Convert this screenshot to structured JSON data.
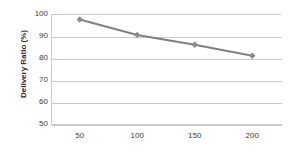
{
  "chart_data": {
    "type": "line",
    "title": "",
    "xlabel": "",
    "ylabel": "Delivery Ratio (%)",
    "x": [
      50,
      100,
      150,
      200
    ],
    "xtick_labels": [
      "50",
      "100",
      "150",
      "200"
    ],
    "ytick_labels": [
      "100",
      "90",
      "80",
      "70",
      "60",
      "50"
    ],
    "yticks": [
      100,
      90,
      80,
      70,
      60,
      50
    ],
    "xlim": [
      25,
      225
    ],
    "ylim": [
      50,
      100
    ],
    "grid": "horizontal",
    "legend": "none",
    "series": [
      {
        "name": "Delivery Ratio",
        "values": [
          97.5,
          90.5,
          86.0,
          81.0
        ],
        "color": "#808080",
        "marker": "diamond",
        "marker_color": "#8a8a8a"
      }
    ]
  },
  "style": {
    "grid_color": "#c9c9c9",
    "axis_color": "#c9c9c9",
    "text_color": "#3a3a3a",
    "title_color": "#303030",
    "background": "#ffffff"
  }
}
